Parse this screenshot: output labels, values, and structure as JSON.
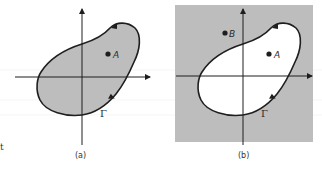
{
  "figure": {
    "panels": [
      {
        "id": "a",
        "caption": "(a)",
        "description": "Closed contour Γ enclosing shaded interior region containing point A",
        "background": "#ffffff",
        "region_fill": "#bdbdbd",
        "points": [
          {
            "label": "A"
          }
        ],
        "contour_label": "Γ"
      },
      {
        "id": "b",
        "caption": "(b)",
        "description": "Closed contour Γ with shaded exterior region; point A inside, point B outside",
        "background": "#bdbdbd",
        "region_fill": "#ffffff",
        "points": [
          {
            "label": "A"
          },
          {
            "label": "B"
          }
        ],
        "contour_label": "Γ"
      }
    ],
    "stray_text": "t",
    "colors": {
      "stroke": "#1e1e1e",
      "shade": "#bdbdbd",
      "paper": "#ffffff"
    }
  }
}
